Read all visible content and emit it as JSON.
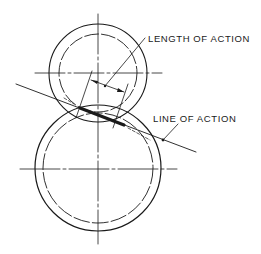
{
  "labels": {
    "length_of_action": "LENGTH OF ACTION",
    "line_of_action": "LINE OF ACTION"
  },
  "colors": {
    "stroke": "#1a1a1a",
    "background": "#ffffff"
  },
  "gears": [
    {
      "name": "pinion",
      "position": "top",
      "outer_circle": "solid",
      "pitch_circle": "dashed"
    },
    {
      "name": "gear",
      "position": "bottom",
      "outer_circle": "solid",
      "pitch_circle": "dashed"
    }
  ]
}
